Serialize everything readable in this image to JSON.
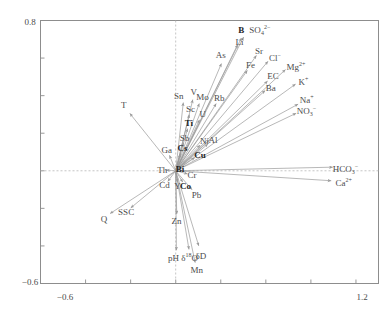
{
  "figure": {
    "type": "biplot-vector-plot",
    "background": "#ffffff",
    "frame_color": "#8a8a8a",
    "arrow_color": "#909090",
    "text_color": "#4b4b4b"
  },
  "axes": {
    "x_ticks": [
      "-0.6",
      "1.2"
    ],
    "y_ticks": [
      "0.8",
      "-0.6"
    ],
    "xlim": [
      -0.9,
      1.35
    ],
    "ylim": [
      -0.6,
      0.8
    ],
    "x_label": "",
    "y_label": "",
    "grid": false,
    "origin_lines": true
  },
  "chart_data": {
    "type": "scatter",
    "title": "",
    "xlabel": "",
    "ylabel": "",
    "xlim": [
      -0.9,
      1.35
    ],
    "ylim": [
      -0.6,
      0.8
    ],
    "x_ticks": [
      -0.6,
      1.2
    ],
    "y_ticks": [
      0.8,
      -0.6
    ],
    "grid": false,
    "legend": "none",
    "vectors": [
      {
        "label": "B",
        "bold": true,
        "x": 0.455,
        "y": 0.735,
        "lx": 0.437,
        "ly": 0.75
      },
      {
        "label": "SO4^2-",
        "bold": false,
        "x": 0.47,
        "y": 0.74,
        "lx": 0.56,
        "ly": 0.748
      },
      {
        "label": "Li",
        "bold": false,
        "x": 0.43,
        "y": 0.7,
        "lx": 0.425,
        "ly": 0.687
      },
      {
        "label": "As",
        "bold": false,
        "x": 0.32,
        "y": 0.6,
        "lx": 0.3,
        "ly": 0.618
      },
      {
        "label": "Sr",
        "bold": false,
        "x": 0.56,
        "y": 0.64,
        "lx": 0.555,
        "ly": 0.64
      },
      {
        "label": "Cl-",
        "bold": false,
        "x": 0.64,
        "y": 0.607,
        "lx": 0.66,
        "ly": 0.608
      },
      {
        "label": "Fe",
        "bold": false,
        "x": 0.5,
        "y": 0.56,
        "lx": 0.498,
        "ly": 0.562
      },
      {
        "label": "Mg^2+",
        "bold": false,
        "x": 0.76,
        "y": 0.56,
        "lx": 0.8,
        "ly": 0.56
      },
      {
        "label": "EC",
        "bold": false,
        "x": 0.64,
        "y": 0.5,
        "lx": 0.648,
        "ly": 0.502
      },
      {
        "label": "K+",
        "bold": false,
        "x": 0.83,
        "y": 0.48,
        "lx": 0.85,
        "ly": 0.48
      },
      {
        "label": "Ba",
        "bold": false,
        "x": 0.625,
        "y": 0.448,
        "lx": 0.632,
        "ly": 0.443
      },
      {
        "label": "Na+",
        "bold": false,
        "x": 0.85,
        "y": 0.37,
        "lx": 0.872,
        "ly": 0.38
      },
      {
        "label": "NO3-",
        "bold": false,
        "x": 0.838,
        "y": 0.32,
        "lx": 0.87,
        "ly": 0.318
      },
      {
        "label": "V",
        "bold": false,
        "x": 0.123,
        "y": 0.41,
        "lx": 0.12,
        "ly": 0.42
      },
      {
        "label": "Mo",
        "bold": false,
        "x": 0.17,
        "y": 0.388,
        "lx": 0.178,
        "ly": 0.392
      },
      {
        "label": "Rb",
        "bold": false,
        "x": 0.29,
        "y": 0.385,
        "lx": 0.29,
        "ly": 0.385
      },
      {
        "label": "Sn",
        "bold": false,
        "x": 0.055,
        "y": 0.395,
        "lx": 0.02,
        "ly": 0.4
      },
      {
        "label": "Sc",
        "bold": false,
        "x": 0.1,
        "y": 0.33,
        "lx": 0.098,
        "ly": 0.33
      },
      {
        "label": "U",
        "bold": false,
        "x": 0.175,
        "y": 0.3,
        "lx": 0.18,
        "ly": 0.3
      },
      {
        "label": "T",
        "bold": false,
        "x": -0.33,
        "y": 0.33,
        "lx": -0.345,
        "ly": 0.348
      },
      {
        "label": "Ti",
        "bold": true,
        "x": 0.09,
        "y": 0.255,
        "lx": 0.088,
        "ly": 0.253
      },
      {
        "label": "Sb",
        "bold": false,
        "x": 0.062,
        "y": 0.18,
        "lx": 0.058,
        "ly": 0.175
      },
      {
        "label": "Ni",
        "bold": false,
        "x": 0.19,
        "y": 0.16,
        "lx": 0.192,
        "ly": 0.16
      },
      {
        "label": "Al",
        "bold": false,
        "x": 0.245,
        "y": 0.163,
        "lx": 0.248,
        "ly": 0.165
      },
      {
        "label": "Cs",
        "bold": true,
        "x": 0.042,
        "y": 0.12,
        "lx": 0.045,
        "ly": 0.12
      },
      {
        "label": "Ga",
        "bold": false,
        "x": -0.055,
        "y": 0.11,
        "lx": -0.06,
        "ly": 0.108
      },
      {
        "label": "Cu",
        "bold": true,
        "x": 0.16,
        "y": 0.088,
        "lx": 0.162,
        "ly": 0.085
      },
      {
        "label": "HCO3-",
        "bold": false,
        "x": 1.085,
        "y": 0.02,
        "lx": 1.13,
        "ly": 0.01
      },
      {
        "label": "Bi",
        "bold": true,
        "x": 0.03,
        "y": 0.01,
        "lx": 0.028,
        "ly": 0.008
      },
      {
        "label": "Th",
        "bold": false,
        "x": -0.085,
        "y": 0.005,
        "lx": -0.09,
        "ly": 0.004
      },
      {
        "label": "Cr",
        "bold": false,
        "x": 0.105,
        "y": -0.022,
        "lx": 0.108,
        "ly": -0.025
      },
      {
        "label": "Ca^2+",
        "bold": false,
        "x": 1.075,
        "y": -0.055,
        "lx": 1.118,
        "ly": -0.062
      },
      {
        "label": "Cd",
        "bold": false,
        "x": -0.07,
        "y": -0.075,
        "lx": -0.075,
        "ly": -0.078
      },
      {
        "label": "Y",
        "bold": false,
        "x": 0.015,
        "y": -0.08,
        "lx": 0.012,
        "ly": -0.082
      },
      {
        "label": "Co",
        "bold": true,
        "x": 0.062,
        "y": -0.08,
        "lx": 0.065,
        "ly": -0.08
      },
      {
        "label": "Pb",
        "bold": false,
        "x": 0.135,
        "y": -0.125,
        "lx": 0.138,
        "ly": -0.128
      },
      {
        "label": "SSC",
        "bold": false,
        "x": -0.33,
        "y": -0.218,
        "lx": -0.33,
        "ly": -0.222
      },
      {
        "label": "Q",
        "bold": false,
        "x": -0.47,
        "y": -0.245,
        "lx": -0.478,
        "ly": -0.255
      },
      {
        "label": "Zn",
        "bold": false,
        "x": 0.008,
        "y": -0.262,
        "lx": 0.005,
        "ly": -0.268
      },
      {
        "label": "pH",
        "bold": false,
        "x": 0.005,
        "y": -0.455,
        "lx": -0.015,
        "ly": -0.462
      },
      {
        "label": "d18O",
        "bold": false,
        "x": 0.095,
        "y": -0.45,
        "lx": 0.092,
        "ly": -0.458
      },
      {
        "label": "dD",
        "bold": false,
        "x": 0.165,
        "y": -0.43,
        "lx": 0.168,
        "ly": -0.452
      },
      {
        "label": "Mn",
        "bold": false,
        "x": 0.138,
        "y": -0.52,
        "lx": 0.14,
        "ly": -0.528
      }
    ]
  },
  "labels": {
    "B": "B",
    "SO4": "SO",
    "SO4_sub": "4",
    "SO4_sup": "2−",
    "Li": "Li",
    "As": "As",
    "Sr": "Sr",
    "Cl": "Cl",
    "Cl_sup": "−",
    "Fe": "Fe",
    "Mg": "Mg",
    "Mg_sup": "2+",
    "EC": "EC",
    "K": "K",
    "K_sup": "+",
    "Ba": "Ba",
    "Na": "Na",
    "Na_sup": "+",
    "NO3": "NO",
    "NO3_sub": "3",
    "NO3_sup": "−",
    "V": "V",
    "Mo": "Mo",
    "Rb": "Rb",
    "Sn": "Sn",
    "Sc": "Sc",
    "U": "U",
    "T": "T",
    "Ti": "Ti",
    "Sb": "Sb",
    "Ni": "Ni",
    "Al": "Al",
    "Cs": "Cs",
    "Ga": "Ga",
    "Cu": "Cu",
    "HCO3": "HCO",
    "HCO3_sub": "3",
    "HCO3_sup": "−",
    "Bi": "Bi",
    "Th": "Th",
    "Cr": "Cr",
    "Ca": "Ca",
    "Ca_sup": "2+",
    "Cd": "Cd",
    "Y": "Y",
    "Co": "Co",
    "Pb": "Pb",
    "SSC": "SSC",
    "Q": "Q",
    "Zn": "Zn",
    "pH": "pH",
    "d18O_d": "δ",
    "d18O_sup": "18",
    "d18O_o": "O",
    "dD_d": "δ",
    "dD_D": "D",
    "Mn": "Mn"
  },
  "ticks": {
    "y_top": "0.8",
    "y_bottom": "−0.6",
    "x_left": "−0.6",
    "x_right": "1.2"
  }
}
